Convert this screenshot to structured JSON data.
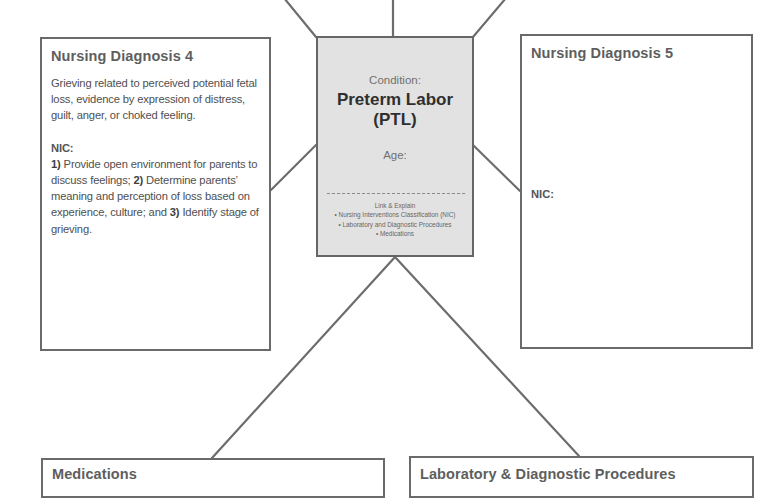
{
  "center": {
    "condition_label": "Condition:",
    "condition_name_line1": "Preterm Labor",
    "condition_name_line2": "(PTL)",
    "age_label": "Age:",
    "link_title": "Link & Explain",
    "link_items": [
      "• Nursing Interventions Classification (NIC)",
      "• Laboratory and Diagnostic Procedures",
      "• Medications"
    ],
    "fill_color": "#e2e2e2"
  },
  "nursing_diagnosis_4": {
    "title": "Nursing Diagnosis 4",
    "diagnosis": "Grieving related to perceived potential fetal loss, evidence by expression of distress, guilt, anger, or choked feeling.",
    "nic_label": "NIC:",
    "nic_items": [
      {
        "num": "1)",
        "text": " Provide open environment for parents to discuss feelings; "
      },
      {
        "num": "2)",
        "text": " Determine parents’ meaning and perception of loss based on experience, culture; and "
      },
      {
        "num": "3)",
        "text": " Identify stage of grieving."
      }
    ]
  },
  "nursing_diagnosis_5": {
    "title": "Nursing Diagnosis 5",
    "nic_label": "NIC:"
  },
  "medications": {
    "title": "Medications"
  },
  "laboratory": {
    "title": "Laboratory & Diagnostic Procedures"
  },
  "colors": {
    "border": "#6a6a6a",
    "title_text": "#5e5e5e",
    "body_text": "#4f4f4f"
  }
}
